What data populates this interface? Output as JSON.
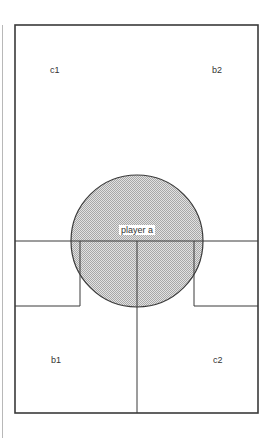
{
  "diagram": {
    "regions": [
      {
        "id": "c1",
        "label": "c1",
        "x": 52,
        "y": 70
      },
      {
        "id": "b2",
        "label": "b2",
        "x": 214,
        "y": 70
      },
      {
        "id": "b1",
        "label": "b1",
        "x": 53,
        "y": 360
      },
      {
        "id": "c2",
        "label": "c2",
        "x": 215,
        "y": 360
      }
    ],
    "player": {
      "label": "player a",
      "cx": 137,
      "cy": 241,
      "r": 66
    },
    "colors": {
      "stroke": "#3a3a3a",
      "fill": "#d4d4d4",
      "margin_line": "#b0b0b0"
    }
  }
}
